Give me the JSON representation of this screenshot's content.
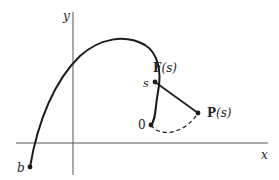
{
  "diagram": {
    "axes": {
      "x_label": "x",
      "y_label": "y"
    },
    "points": {
      "start": {
        "label": "b"
      },
      "origin": {
        "label": "0"
      },
      "arc_label": "s",
      "F": {
        "label_main": "F",
        "label_arg": "(s)"
      },
      "P": {
        "label_main": "P",
        "label_arg": "(s)"
      }
    },
    "colors": {
      "stroke": "#1a1a1a",
      "axis": "#555555",
      "background": "#ffffff"
    }
  }
}
